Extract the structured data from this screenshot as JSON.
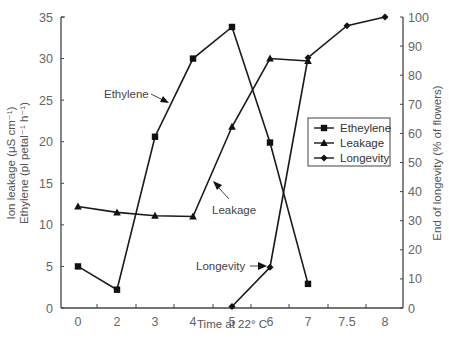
{
  "chart_data": {
    "type": "line",
    "title": "",
    "xlabel": "Time at 22° C",
    "ylabel_left_line1": "Ion leakage (μS cm⁻¹)",
    "ylabel_left_line2": "Ethylene (pl petal⁻¹ h⁻¹)",
    "ylabel_right": "End of longevity (% of flowers)",
    "categories": [
      "0",
      "2",
      "3",
      "4",
      "5",
      "6",
      "7",
      "7.5",
      "8"
    ],
    "ylim_left": [
      0,
      35
    ],
    "yticks_left": [
      0,
      5,
      10,
      15,
      20,
      25,
      30,
      35
    ],
    "ylim_right": [
      0,
      100
    ],
    "yticks_right": [
      0,
      10,
      20,
      30,
      40,
      50,
      60,
      70,
      80,
      90,
      100
    ],
    "grid": false,
    "legend_position": "right-middle, inside plot",
    "series": [
      {
        "name": "Etheylene",
        "axis": "left",
        "marker": "square",
        "x": [
          "0",
          "2",
          "3",
          "4",
          "5",
          "6",
          "7"
        ],
        "values": [
          5.0,
          2.2,
          20.6,
          30.0,
          33.8,
          19.9,
          2.9
        ]
      },
      {
        "name": "Leakage",
        "axis": "left",
        "marker": "triangle",
        "x": [
          "0",
          "2",
          "3",
          "4",
          "5",
          "6",
          "7"
        ],
        "values": [
          12.2,
          11.5,
          11.1,
          11.0,
          21.8,
          30.0,
          29.7
        ]
      },
      {
        "name": "Longevity",
        "axis": "right",
        "marker": "diamond",
        "x": [
          "5",
          "6",
          "7",
          "7.5",
          "8"
        ],
        "values": [
          0.5,
          14,
          86,
          97,
          100
        ]
      }
    ],
    "annotations": [
      {
        "text": "Ethylene",
        "points_to": "Etheylene series near x=3"
      },
      {
        "text": "Leakage",
        "points_to": "Leakage series near x=4.5"
      },
      {
        "text": "Longevity",
        "points_to": "Longevity series at x=6"
      }
    ]
  },
  "labels": {
    "xlabel": "Time at 22° C",
    "ylabel_left_line1": "Ion leakage (μS cm⁻¹)",
    "ylabel_left_line2": "Ethylene (pl petal⁻¹ h⁻¹)",
    "ylabel_right": "End of longevity (% of flowers)",
    "annot_ethylene": "Ethylene",
    "annot_leakage": "Leakage",
    "annot_longevity": "Longevity",
    "legend": [
      "Etheylene",
      "Leakage",
      "Longevity"
    ]
  }
}
